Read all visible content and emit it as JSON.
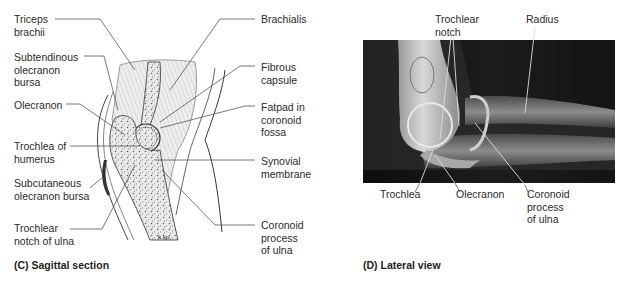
{
  "panel_c": {
    "caption": "(C) Sagittal section",
    "signature": "k.sp.",
    "labels_left": [
      "Triceps\nbrachii",
      "Subtendinous\nolecranon\nbursa",
      "Olecranon",
      "Trochlea of\nhumerus",
      "Subcutaneous\nolecranon bursa",
      "Trochlear\nnotch of ulna"
    ],
    "labels_right": [
      "Brachialis",
      "Fibrous\ncapsule",
      "Fatpad in\ncoronoid\nfossa",
      "Synovial\nmembrane",
      "Coronoid\nprocess\nof ulna"
    ]
  },
  "panel_d": {
    "caption": "(D) Lateral view",
    "labels_top": [
      "Trochlear\nnotch",
      "Radius"
    ],
    "labels_bottom": [
      "Trochlea",
      "Olecranon",
      "Coronoid\nprocess\nof ulna"
    ]
  }
}
